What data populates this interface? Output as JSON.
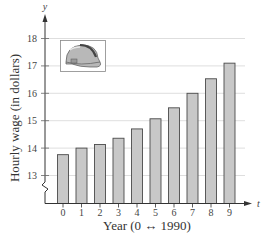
{
  "chart_data": {
    "type": "bar",
    "title": "",
    "xlabel": "Year (0 ↔ 1990)",
    "ylabel": "Hourly wage (in dollars)",
    "x_axis_var": "t",
    "y_axis_var": "y",
    "categories": [
      "0",
      "1",
      "2",
      "3",
      "4",
      "5",
      "6",
      "7",
      "8",
      "9"
    ],
    "values": [
      13.76,
      14.0,
      14.13,
      14.36,
      14.7,
      15.07,
      15.47,
      16.0,
      16.53,
      17.1
    ],
    "yticks": [
      13,
      14,
      15,
      16,
      17,
      18
    ],
    "ylim": [
      12.0,
      18.5
    ],
    "y_axis_break": true,
    "grid": true,
    "legend": null,
    "annotations": [
      "hard-hat illustration (upper left)"
    ]
  },
  "colors": {
    "bar_fill": "#c8c8c8",
    "bar_stroke": "#4a4a4a",
    "grid": "#d6d6d6",
    "axis": "#333333"
  },
  "icons": {
    "illustration": "hard-hat-icon"
  }
}
